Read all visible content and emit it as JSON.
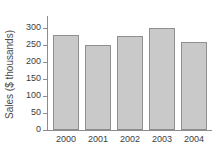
{
  "chart_data": {
    "type": "bar",
    "title": "",
    "xlabel": "",
    "ylabel": "Sales ($ thousands)",
    "categories": [
      "2000",
      "2001",
      "2002",
      "2003",
      "2004"
    ],
    "values": [
      280,
      250,
      277,
      300,
      260
    ],
    "ylim": [
      0,
      300
    ],
    "yticks": [
      0,
      50,
      100,
      150,
      200,
      250,
      300
    ],
    "ytick_labels": [
      "0",
      "50",
      "100",
      "150",
      "200",
      "250",
      "300"
    ],
    "grid": false,
    "legend": null,
    "colors": {
      "bar_fill": "#c9c9c9",
      "bar_edge": "#8f8f8f",
      "axis": "#8c8c8c",
      "text": "#3d3d3d",
      "background": "#ffffff"
    }
  }
}
